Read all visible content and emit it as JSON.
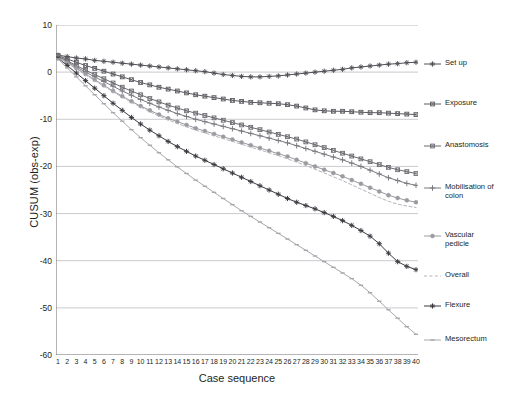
{
  "chart_data": {
    "type": "line",
    "title": "",
    "xlabel": "Case sequence",
    "ylabel": "CUSUM (obs-exp)",
    "xlim": [
      1,
      40
    ],
    "ylim": [
      -60,
      10
    ],
    "yticks": [
      10,
      0,
      -10,
      -20,
      -30,
      -40,
      -50,
      -60
    ],
    "grid": "horizontal",
    "legend_position": "right",
    "x": [
      1,
      2,
      3,
      4,
      5,
      6,
      7,
      8,
      9,
      10,
      11,
      12,
      13,
      14,
      15,
      16,
      17,
      18,
      19,
      20,
      21,
      22,
      23,
      24,
      25,
      26,
      27,
      28,
      29,
      30,
      31,
      32,
      33,
      34,
      35,
      36,
      37,
      38,
      39,
      40
    ],
    "categories": [
      "1",
      "2",
      "3",
      "4",
      "5",
      "6",
      "7",
      "8",
      "9",
      "10",
      "11",
      "12",
      "13",
      "14",
      "15",
      "16",
      "17",
      "18",
      "19",
      "20",
      "21",
      "22",
      "23",
      "24",
      "25",
      "26",
      "27",
      "28",
      "29",
      "30",
      "31",
      "32",
      "33",
      "34",
      "35",
      "36",
      "37",
      "38",
      "39",
      "40"
    ],
    "series": [
      {
        "name": "Set up",
        "color": "#4f4f55",
        "marker": "star",
        "dash": "none",
        "values": [
          3.6,
          3.3,
          3.0,
          2.8,
          2.5,
          2.3,
          2.1,
          1.9,
          1.7,
          1.5,
          1.3,
          1.1,
          0.9,
          0.7,
          0.5,
          0.3,
          0.1,
          -0.2,
          -0.5,
          -0.7,
          -0.9,
          -1.0,
          -1.0,
          -0.9,
          -0.8,
          -0.6,
          -0.4,
          -0.2,
          0.0,
          0.2,
          0.4,
          0.6,
          0.9,
          1.1,
          1.3,
          1.5,
          1.7,
          1.8,
          2.0,
          2.1
        ]
      },
      {
        "name": "Exposure",
        "color": "#5b5b61",
        "marker": "square-x",
        "dash": "none",
        "values": [
          3.5,
          2.8,
          2.1,
          1.4,
          0.8,
          0.2,
          -0.4,
          -1.0,
          -1.6,
          -2.2,
          -2.7,
          -3.2,
          -3.6,
          -4.0,
          -4.4,
          -4.8,
          -5.1,
          -5.4,
          -5.7,
          -6.0,
          -6.2,
          -6.4,
          -6.5,
          -6.6,
          -6.7,
          -6.9,
          -7.2,
          -7.6,
          -8.0,
          -8.2,
          -8.3,
          -8.3,
          -8.4,
          -8.5,
          -8.6,
          -8.6,
          -8.7,
          -8.8,
          -8.9,
          -9.0
        ]
      },
      {
        "name": "Anastomosis",
        "color": "#6a6a70",
        "marker": "square-x",
        "dash": "none",
        "values": [
          3.4,
          2.4,
          1.4,
          0.4,
          -0.5,
          -1.4,
          -2.3,
          -3.2,
          -4.0,
          -4.8,
          -5.6,
          -6.3,
          -7.0,
          -7.6,
          -8.2,
          -8.7,
          -9.2,
          -9.7,
          -10.2,
          -10.7,
          -11.2,
          -11.7,
          -12.2,
          -12.7,
          -13.2,
          -13.7,
          -14.2,
          -14.8,
          -15.4,
          -16.0,
          -16.6,
          -17.2,
          -17.8,
          -18.4,
          -19.0,
          -19.6,
          -20.2,
          -20.7,
          -21.1,
          -21.5
        ]
      },
      {
        "name": "Mobilisation of\ncolon",
        "color": "#7a7a80",
        "marker": "plus",
        "dash": "none",
        "values": [
          3.3,
          2.2,
          1.1,
          0.0,
          -1.0,
          -2.0,
          -3.0,
          -4.0,
          -4.9,
          -5.8,
          -6.6,
          -7.4,
          -8.1,
          -8.8,
          -9.4,
          -10.0,
          -10.5,
          -11.0,
          -11.5,
          -12.0,
          -12.5,
          -13.0,
          -13.5,
          -14.0,
          -14.5,
          -15.0,
          -15.6,
          -16.2,
          -16.8,
          -17.4,
          -18.0,
          -18.6,
          -19.3,
          -20.0,
          -20.8,
          -21.6,
          -22.4,
          -23.0,
          -23.6,
          -24.0
        ]
      },
      {
        "name": "Vascular\npedicle",
        "color": "#9a9aa0",
        "marker": "circle",
        "dash": "none",
        "values": [
          3.2,
          2.0,
          0.8,
          -0.4,
          -1.6,
          -2.8,
          -4.0,
          -5.1,
          -6.2,
          -7.2,
          -8.1,
          -9.0,
          -9.8,
          -10.5,
          -11.2,
          -11.9,
          -12.5,
          -13.1,
          -13.7,
          -14.3,
          -14.9,
          -15.5,
          -16.1,
          -16.7,
          -17.3,
          -17.9,
          -18.6,
          -19.3,
          -20.0,
          -20.7,
          -21.4,
          -22.1,
          -22.9,
          -23.7,
          -24.5,
          -25.3,
          -26.1,
          -26.7,
          -27.2,
          -27.6
        ]
      },
      {
        "name": "Overall",
        "color": "#b4b4ba",
        "marker": "none",
        "dash": "dashed",
        "values": [
          3.2,
          1.9,
          0.7,
          -0.6,
          -1.8,
          -3.0,
          -4.2,
          -5.3,
          -6.4,
          -7.4,
          -8.4,
          -9.3,
          -10.1,
          -10.9,
          -11.6,
          -12.3,
          -12.9,
          -13.5,
          -14.1,
          -14.7,
          -15.3,
          -15.9,
          -16.5,
          -17.1,
          -17.7,
          -18.4,
          -19.1,
          -19.8,
          -20.6,
          -21.4,
          -22.2,
          -23.0,
          -23.9,
          -24.8,
          -25.7,
          -26.6,
          -27.4,
          -28.0,
          -28.4,
          -28.7
        ]
      },
      {
        "name": "Flexure",
        "color": "#3a3a41",
        "marker": "star",
        "dash": "none",
        "values": [
          3.0,
          1.4,
          -0.2,
          -1.8,
          -3.4,
          -5.0,
          -6.6,
          -8.1,
          -9.6,
          -11.0,
          -12.3,
          -13.5,
          -14.7,
          -15.8,
          -16.8,
          -17.8,
          -18.7,
          -19.6,
          -20.5,
          -21.4,
          -22.3,
          -23.2,
          -24.1,
          -25.0,
          -25.9,
          -26.8,
          -27.6,
          -28.3,
          -29.0,
          -29.8,
          -30.6,
          -31.5,
          -32.5,
          -33.6,
          -34.8,
          -36.4,
          -38.4,
          -40.2,
          -41.2,
          -41.9
        ]
      },
      {
        "name": "Mesorectum",
        "color": "#a8a8ae",
        "marker": "dash",
        "dash": "none",
        "values": [
          2.8,
          0.9,
          -1.0,
          -2.9,
          -4.8,
          -6.7,
          -8.6,
          -10.4,
          -12.2,
          -13.9,
          -15.5,
          -17.1,
          -18.6,
          -20.1,
          -21.5,
          -22.9,
          -24.2,
          -25.5,
          -26.8,
          -28.1,
          -29.4,
          -30.6,
          -31.8,
          -33.0,
          -34.2,
          -35.4,
          -36.6,
          -37.8,
          -39.0,
          -40.2,
          -41.4,
          -42.6,
          -43.8,
          -45.2,
          -46.8,
          -48.6,
          -50.4,
          -52.2,
          -54.0,
          -55.6
        ]
      }
    ]
  },
  "legend": {
    "items": [
      {
        "label": "Set up"
      },
      {
        "label": "Exposure"
      },
      {
        "label": "Anastomosis"
      },
      {
        "label": "Mobilisation of\ncolon"
      },
      {
        "label": "Vascular\npedicle"
      },
      {
        "label": "Overall"
      },
      {
        "label": "Flexure"
      },
      {
        "label": "Mesorectum"
      }
    ]
  }
}
